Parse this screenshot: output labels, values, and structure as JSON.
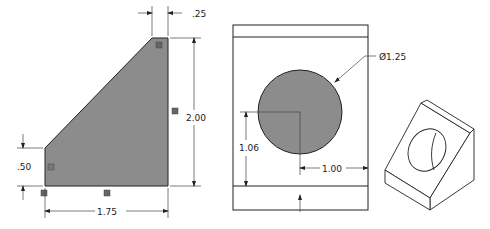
{
  "drawing": {
    "title": "Angle block engineering drawing",
    "views": {
      "side": {
        "label": "Side view (profile)",
        "dimensions": {
          "top_width": ".25",
          "height": "2.00",
          "lower_height": ".50",
          "base_width": "1.75"
        },
        "fill_color": "#8c8c8c"
      },
      "front": {
        "label": "Front view",
        "dimensions": {
          "hole_diameter": "Ø1.25",
          "hole_center_height": "1.06",
          "hole_center_from_right": "1.00"
        },
        "fill_color": "#8c8c8c"
      },
      "isometric": {
        "label": "Isometric view"
      }
    },
    "colors": {
      "line": "#222222",
      "shade": "#8c8c8c",
      "background": "#ffffff"
    }
  }
}
